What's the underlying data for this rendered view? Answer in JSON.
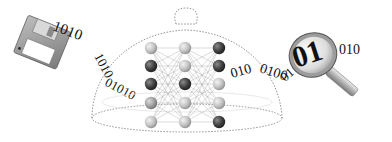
{
  "diagram": {
    "source": {
      "name": "floppy-disk",
      "binary_stream": "1010101001010"
    },
    "container": {
      "name": "glass-dome",
      "network": {
        "layers": [
          {
            "nodes": [
              "light",
              "dark",
              "dark",
              "mid",
              "light"
            ]
          },
          {
            "nodes": [
              "light",
              "light",
              "dark",
              "light",
              "light"
            ]
          },
          {
            "nodes": [
              "dark",
              "dark",
              "light",
              "light",
              "dark"
            ]
          }
        ],
        "fully_connected": true
      }
    },
    "flow_text": {
      "left": "1010",
      "left_arc": "01010010",
      "right": "0100101001",
      "magnifier_label": "01",
      "right_tail": "010"
    },
    "target": {
      "name": "magnifying-glass",
      "lens_text": "01"
    },
    "colors": {
      "light_node": "#c9c9c9",
      "mid_node": "#a8a8a8",
      "dark_node": "#3d3d3d",
      "edge": "#9a9a9a",
      "dome_outline": "#777777"
    }
  }
}
